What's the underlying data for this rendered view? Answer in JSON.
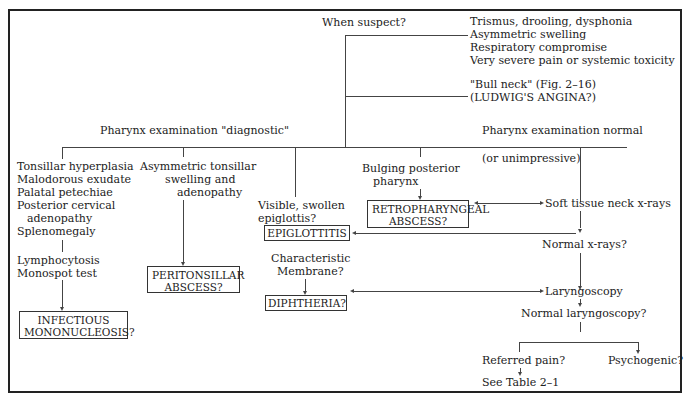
{
  "when_suspect": {
    "question": "When suspect?",
    "criteria": [
      "Trismus, drooling, dysphonia",
      "Asymmetric swelling",
      "Respiratory compromise",
      "Very severe pain or systemic toxicity"
    ],
    "bull_neck": "\"Bull neck\" (Fig. 2–16)",
    "ludwig": "(LUDWIG'S ANGINA?)"
  },
  "branches": {
    "diagnostic": "Pharynx examination \"diagnostic\"",
    "normal": "Pharynx examination normal",
    "normal_sub": "(or unimpressive)"
  },
  "mono": {
    "findings": [
      "Tonsillar hyperplasia",
      "Malodorous exudate",
      "Palatal petechiae",
      "Posterior cervical",
      "adenopathy",
      "Splenomegaly"
    ],
    "tests": [
      "Lymphocytosis",
      "Monospot test"
    ],
    "dx": [
      "INFECTIOUS",
      "MONONUCLEOSIS?"
    ]
  },
  "peritonsillar": {
    "findings": [
      "Asymmetric tonsillar",
      "swelling and",
      "adenopathy"
    ],
    "dx": [
      "PERITONSILLAR",
      "ABSCESS?"
    ]
  },
  "epiglottitis": {
    "findings": [
      "Visible, swollen",
      "epiglottis?"
    ],
    "dx": "EPIGLOTTITIS"
  },
  "diphtheria": {
    "findings": [
      "Characteristic",
      "Membrane?"
    ],
    "dx": "DIPHTHERIA?"
  },
  "retro": {
    "findings": [
      "Bulging posterior",
      "pharynx"
    ],
    "dx": [
      "RETROPHARYNGEAL",
      "ABSCESS?"
    ]
  },
  "workup": {
    "xrays": "Soft tissue neck x-rays",
    "normal_xrays": "Normal x-rays?",
    "laryngoscopy": "Laryngoscopy",
    "normal_laryngoscopy": "Normal laryngoscopy?",
    "referred": "Referred pain?",
    "see_table": "See Table 2–1",
    "psychogenic": "Psychogenic?"
  }
}
